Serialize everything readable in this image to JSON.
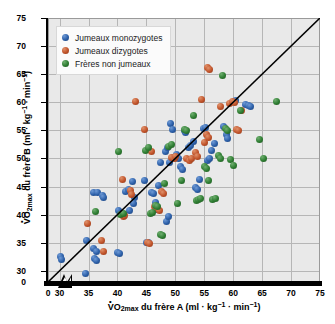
{
  "chart": {
    "type": "scatter",
    "title": "",
    "xlabel_plain": "VO2max du frère A (ml · kg-1 · min-1)",
    "ylabel_plain": "VO2max du frère B (ml · kg-1 · min-1)",
    "xlabel_parts": {
      "v": "V",
      "o": "O",
      "sub": "2max",
      "mid": " du frère A (ml · kg",
      "sup1": "-1",
      "mid2": " · min",
      "sup2": "-1",
      "end": ")"
    },
    "ylabel_parts": {
      "v": "V",
      "o": "O",
      "sub": "2max",
      "mid": " du frère B (ml · kg",
      "sup1": "-1",
      "mid2": " · min",
      "sup2": "-1",
      "end": ")"
    },
    "xlim": [
      28,
      75
    ],
    "ylim": [
      28,
      75
    ],
    "xticks": [
      0,
      30,
      35,
      40,
      45,
      50,
      55,
      60,
      65,
      70,
      75
    ],
    "yticks": [
      0,
      30,
      35,
      40,
      45,
      50,
      55,
      60,
      65,
      70,
      75
    ],
    "axis_break": true,
    "grid": true,
    "grid_color": "#b6b6b6",
    "plot_bg": "#e9e9e9",
    "identity_line": {
      "from": [
        28,
        28
      ],
      "to": [
        75,
        75
      ],
      "color": "#000000"
    },
    "legend_position": "top-left",
    "series": [
      {
        "name": "Jumeaux monozygotes",
        "key": "mono",
        "color": "#2c5fa8",
        "points": [
          [
            30.2,
            32.6
          ],
          [
            30.4,
            32.0
          ],
          [
            30.1,
            25.4
          ],
          [
            34.6,
            35.4
          ],
          [
            34.4,
            29.6
          ],
          [
            35.8,
            43.9
          ],
          [
            36.5,
            43.9
          ],
          [
            37.4,
            43.4
          ],
          [
            37.6,
            43.1
          ],
          [
            35.9,
            33.9
          ],
          [
            36.3,
            33.4
          ],
          [
            36.1,
            32.2
          ],
          [
            36.4,
            31.9
          ],
          [
            40.1,
            40.7
          ],
          [
            40.0,
            33.2
          ],
          [
            40.3,
            33.0
          ],
          [
            41.4,
            44.1
          ],
          [
            41.9,
            44.5
          ],
          [
            42.6,
            45.9
          ],
          [
            43.0,
            43.0
          ],
          [
            42.1,
            40.7
          ],
          [
            42.8,
            42.0
          ],
          [
            44.6,
            46.0
          ],
          [
            45.0,
            35.1
          ],
          [
            45.4,
            35.0
          ],
          [
            46.5,
            42.1
          ],
          [
            46.8,
            40.9
          ],
          [
            47.1,
            45.2
          ],
          [
            47.4,
            49.3
          ],
          [
            45.8,
            44.0
          ],
          [
            46.2,
            43.7
          ],
          [
            48.5,
            38.7
          ],
          [
            48.8,
            39.6
          ],
          [
            48.3,
            51.3
          ],
          [
            48.6,
            51.9
          ],
          [
            49.2,
            56.2
          ],
          [
            49.5,
            55.1
          ],
          [
            49.0,
            49.3
          ],
          [
            49.7,
            50.2
          ],
          [
            50.2,
            50.7
          ],
          [
            50.6,
            50.0
          ],
          [
            50.9,
            48.5
          ],
          [
            51.2,
            48.0
          ],
          [
            51.5,
            55.0
          ],
          [
            51.8,
            54.6
          ],
          [
            52.2,
            52.0
          ],
          [
            52.6,
            52.3
          ],
          [
            53.1,
            53.1
          ],
          [
            53.5,
            44.8
          ],
          [
            53.8,
            44.4
          ],
          [
            54.1,
            46.3
          ],
          [
            54.8,
            55.3
          ],
          [
            55.2,
            55.5
          ],
          [
            55.6,
            49.7
          ],
          [
            55.9,
            50.0
          ],
          [
            56.3,
            51.5
          ],
          [
            56.8,
            52.6
          ],
          [
            58.4,
            55.6
          ],
          [
            58.8,
            54.3
          ],
          [
            59.1,
            53.5
          ],
          [
            60.4,
            60.3
          ],
          [
            62.1,
            59.6
          ],
          [
            62.6,
            59.4
          ],
          [
            63.0,
            59.2
          ]
        ]
      },
      {
        "name": "Jumeaux dizygotes",
        "key": "di",
        "color": "#c0532a",
        "points": [
          [
            34.8,
            38.5
          ],
          [
            37.3,
            35.3
          ],
          [
            37.6,
            33.5
          ],
          [
            40.8,
            46.2
          ],
          [
            41.0,
            39.6
          ],
          [
            41.3,
            39.8
          ],
          [
            42.2,
            44.3
          ],
          [
            42.5,
            43.6
          ],
          [
            43.1,
            60.1
          ],
          [
            44.6,
            55.1
          ],
          [
            44.8,
            27.1
          ],
          [
            45.2,
            35.1
          ],
          [
            45.6,
            34.9
          ],
          [
            45.9,
            51.3
          ],
          [
            46.4,
            41.5
          ],
          [
            46.8,
            41.0
          ],
          [
            47.2,
            40.7
          ],
          [
            47.6,
            44.2
          ],
          [
            48.0,
            43.8
          ],
          [
            49.4,
            50.1
          ],
          [
            49.8,
            49.9
          ],
          [
            50.1,
            50.3
          ],
          [
            52.0,
            50.0
          ],
          [
            52.4,
            49.6
          ],
          [
            52.8,
            49.9
          ],
          [
            53.5,
            51.0
          ],
          [
            53.9,
            50.4
          ],
          [
            54.6,
            60.5
          ],
          [
            55.0,
            52.9
          ],
          [
            55.4,
            54.2
          ],
          [
            55.8,
            53.8
          ],
          [
            55.5,
            66.2
          ],
          [
            55.9,
            65.8
          ],
          [
            57.8,
            59.3
          ],
          [
            59.4,
            59.8
          ],
          [
            59.8,
            60.2
          ],
          [
            60.2,
            60.0
          ],
          [
            60.6,
            55.2
          ],
          [
            61.0,
            54.9
          ],
          [
            61.4,
            58.6
          ]
        ]
      },
      {
        "name": "Frères non jumeaux",
        "key": "nonj",
        "color": "#2e7d32",
        "points": [
          [
            36.2,
            40.6
          ],
          [
            40.1,
            51.3
          ],
          [
            40.5,
            40.1
          ],
          [
            41.0,
            40.2
          ],
          [
            44.8,
            51.5
          ],
          [
            45.3,
            52.0
          ],
          [
            45.7,
            40.2
          ],
          [
            46.1,
            40.4
          ],
          [
            46.6,
            41.6
          ],
          [
            47.0,
            41.4
          ],
          [
            47.4,
            36.4
          ],
          [
            47.8,
            36.2
          ],
          [
            48.2,
            45.6
          ],
          [
            48.9,
            52.2
          ],
          [
            49.3,
            52.4
          ],
          [
            50.4,
            41.9
          ],
          [
            51.0,
            46.0
          ],
          [
            51.6,
            55.2
          ],
          [
            52.0,
            55.0
          ],
          [
            53.2,
            57.6
          ],
          [
            53.6,
            42.5
          ],
          [
            54.0,
            42.6
          ],
          [
            54.4,
            42.8
          ],
          [
            55.0,
            48.5
          ],
          [
            55.4,
            48.2
          ],
          [
            55.8,
            46.1
          ],
          [
            56.4,
            42.6
          ],
          [
            56.9,
            42.9
          ],
          [
            57.4,
            50.6
          ],
          [
            57.8,
            50.0
          ],
          [
            58.2,
            64.8
          ],
          [
            58.6,
            55.4
          ],
          [
            59.0,
            55.0
          ],
          [
            59.6,
            49.8
          ],
          [
            60.0,
            48.7
          ],
          [
            61.2,
            58.5
          ],
          [
            64.6,
            53.3
          ],
          [
            65.2,
            49.9
          ],
          [
            67.5,
            60.2
          ]
        ]
      }
    ]
  },
  "legend": {
    "items": [
      {
        "label": "Jumeaux monozygotes",
        "key": "mono"
      },
      {
        "label": "Jumeaux dizygotes",
        "key": "di"
      },
      {
        "label": "Frères non jumeaux",
        "key": "nonj"
      }
    ]
  }
}
